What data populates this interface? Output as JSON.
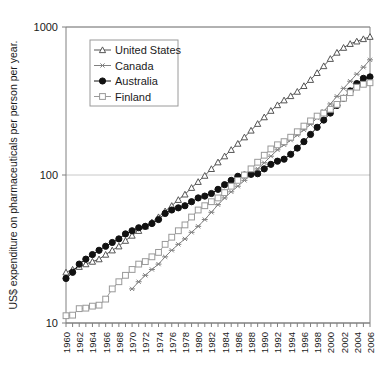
{
  "chart_data": {
    "type": "line",
    "title": "",
    "xlabel": "",
    "ylabel": "US$ expenditure on  pharmaceuticals per person per year.",
    "yscale": "log",
    "ylim": [
      10,
      1000
    ],
    "ytick_labels": [
      "1000",
      "100",
      "10"
    ],
    "yticks": [
      1000,
      100,
      10
    ],
    "xlim": [
      1960,
      2006
    ],
    "grid": "horizontal-major",
    "legend_position": "top-left-inside",
    "x": [
      1960,
      1961,
      1962,
      1963,
      1964,
      1965,
      1966,
      1967,
      1968,
      1969,
      1970,
      1971,
      1972,
      1973,
      1974,
      1975,
      1976,
      1977,
      1978,
      1979,
      1980,
      1981,
      1982,
      1983,
      1984,
      1985,
      1986,
      1987,
      1988,
      1989,
      1990,
      1991,
      1992,
      1993,
      1994,
      1995,
      1996,
      1997,
      1998,
      1999,
      2000,
      2001,
      2002,
      2003,
      2004,
      2005,
      2006
    ],
    "xtick_labels": [
      "1960",
      "1962",
      "1964",
      "1966",
      "1968",
      "1970",
      "1972",
      "1974",
      "1976",
      "1978",
      "1980",
      "1982",
      "1984",
      "1986",
      "1988",
      "1990",
      "1992",
      "1994",
      "1996",
      "1998",
      "2000",
      "2002",
      "2004",
      "2006"
    ],
    "series": [
      {
        "name": "United States",
        "marker": "open-triangle",
        "color": "#555555",
        "values": [
          22,
          23,
          24,
          25,
          26,
          27,
          29,
          31,
          33,
          36,
          39,
          42,
          45,
          48,
          52,
          57,
          62,
          68,
          74,
          82,
          90,
          99,
          110,
          122,
          134,
          148,
          163,
          180,
          200,
          222,
          246,
          272,
          297,
          320,
          342,
          366,
          400,
          440,
          490,
          545,
          610,
          672,
          725,
          770,
          800,
          830,
          860
        ]
      },
      {
        "name": "Canada",
        "marker": "asterisk",
        "color": "#808080",
        "values": [
          null,
          null,
          null,
          null,
          null,
          null,
          null,
          null,
          null,
          null,
          17,
          19,
          21,
          23,
          25,
          28,
          31,
          34,
          37,
          41,
          45,
          50,
          56,
          63,
          70,
          77,
          84,
          92,
          100,
          110,
          121,
          134,
          148,
          160,
          172,
          186,
          202,
          220,
          243,
          270,
          302,
          340,
          385,
          430,
          480,
          535,
          600
        ]
      },
      {
        "name": "Australia",
        "marker": "solid-circle",
        "color": "#111111",
        "values": [
          20,
          22,
          25,
          27,
          29,
          31,
          33,
          35,
          37,
          40,
          42,
          44,
          45,
          47,
          50,
          55,
          58,
          60,
          62,
          66,
          70,
          72,
          75,
          80,
          86,
          92,
          98,
          100,
          101,
          102,
          110,
          118,
          124,
          128,
          138,
          152,
          168,
          188,
          210,
          235,
          262,
          295,
          330,
          370,
          415,
          450,
          460
        ]
      },
      {
        "name": "Finland",
        "marker": "open-square",
        "color": "#999999",
        "values": [
          11.2,
          11.3,
          12.5,
          12.6,
          13.0,
          13.2,
          14.5,
          17,
          19,
          21,
          23,
          25,
          26,
          28,
          30,
          34,
          38,
          42,
          46,
          52,
          58,
          62,
          66,
          70,
          76,
          84,
          92,
          100,
          110,
          122,
          136,
          150,
          160,
          168,
          180,
          196,
          214,
          232,
          250,
          262,
          278,
          300,
          330,
          360,
          392,
          410,
          420
        ]
      }
    ]
  },
  "legend": {
    "items": [
      {
        "label": "United States"
      },
      {
        "label": "Canada"
      },
      {
        "label": "Australia"
      },
      {
        "label": "Finland"
      }
    ]
  }
}
